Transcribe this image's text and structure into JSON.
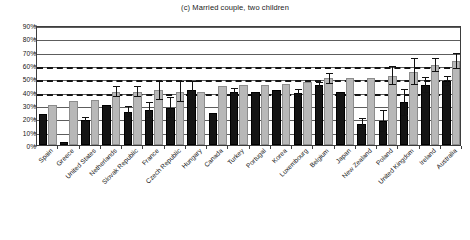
{
  "chart_data": {
    "type": "bar",
    "title": "(c) Married couple, two children",
    "xlabel": "",
    "ylabel": "",
    "ylim": [
      0,
      90
    ],
    "ytick_labels": [
      "0%",
      "10%",
      "20%",
      "30%",
      "40%",
      "50%",
      "60%",
      "70%",
      "80%",
      "90%"
    ],
    "ytick_values": [
      0,
      10,
      20,
      30,
      40,
      50,
      60,
      70,
      80,
      90
    ],
    "grid": true,
    "legend_position": "none",
    "reference_lines": [
      {
        "value": 60,
        "style": "dashed"
      },
      {
        "value": 50,
        "style": "dashed"
      },
      {
        "value": 40,
        "style": "dashed"
      }
    ],
    "categories": [
      "Spain",
      "Greece",
      "United States",
      "Netherlands",
      "Slovak Republic",
      "France",
      "Czech Republic",
      "Hungary",
      "Canada",
      "Turkey",
      "Portugal",
      "Korea",
      "Luxembourg",
      "Belgium",
      "Japan",
      "New Zealand",
      "Poland",
      "United Kingdom",
      "Ireland",
      "Australia"
    ],
    "series": [
      {
        "name": "dark-series",
        "color": "#141414",
        "values": [
          23,
          2,
          19,
          30,
          25,
          26,
          28,
          41,
          24,
          40,
          40,
          41,
          39,
          45,
          40,
          16,
          18,
          32,
          45,
          48
        ],
        "errors": [
          0,
          0,
          2,
          0,
          4,
          6,
          8,
          7,
          0,
          3,
          0,
          0,
          3,
          2,
          0,
          4,
          8,
          10,
          6,
          4
        ]
      },
      {
        "name": "light-series",
        "color": "#b8b8b8",
        "values": [
          30,
          33,
          34,
          40,
          40,
          41,
          40,
          40,
          44,
          45,
          45,
          46,
          47,
          50,
          50,
          50,
          52,
          55,
          60,
          63
        ],
        "errors": [
          0,
          0,
          0,
          4,
          4,
          7,
          8,
          0,
          0,
          0,
          0,
          0,
          0,
          4,
          0,
          0,
          7,
          10,
          5,
          6
        ]
      }
    ]
  }
}
